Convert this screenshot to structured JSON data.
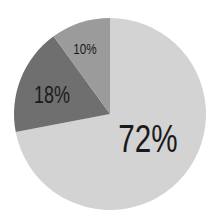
{
  "chart_data": {
    "type": "pie",
    "title": "",
    "start_angle_deg": -90,
    "direction": "clockwise",
    "slices": [
      {
        "label": "72%",
        "value": 72,
        "color": "#d3d3d3"
      },
      {
        "label": "18%",
        "value": 18,
        "color": "#6f6f6f"
      },
      {
        "label": "10%",
        "value": 10,
        "color": "#9b9b9b"
      }
    ],
    "legend": "none"
  },
  "labels": {
    "slice_0": "72%",
    "slice_1": "18%",
    "slice_2": "10%"
  }
}
